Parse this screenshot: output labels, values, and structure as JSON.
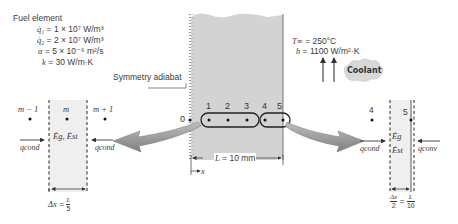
{
  "fuel_element": {
    "title": "Fuel element",
    "props": [
      {
        "sym": "q̇₁",
        "eq": " = 1 × 10⁷ W/m³"
      },
      {
        "sym": "q̇₂",
        "eq": " = 2 × 10⁷ W/m³"
      },
      {
        "sym": "α",
        "eq": " = 5 × 10⁻⁶ m²/s"
      },
      {
        "sym": "k",
        "eq": " = 30 W/m·K"
      }
    ]
  },
  "symmetry_label": "Symmetry adiabat",
  "coolant": {
    "T_inf": {
      "sym": "T∞",
      "eq": " = 250°C"
    },
    "h": {
      "sym": "h",
      "eq": " = 1100 W/m²·K"
    },
    "label": "Coolant"
  },
  "nodes": [
    "0",
    "1",
    "2",
    "3",
    "4",
    "5"
  ],
  "dimension": {
    "sym": "L",
    "eq": " = 10 mm"
  },
  "x_axis": "x",
  "left_detail": {
    "nodes": [
      "m − 1",
      "m",
      "m + 1"
    ],
    "energy": "Ėg, Ėst",
    "q_left": "qcond",
    "q_right": "qcond",
    "dx": "Δx = L/5",
    "dx_num": "Δx",
    "L": "L",
    "den": "5"
  },
  "right_detail": {
    "nodes": [
      "4",
      "5"
    ],
    "eg": "Ėg",
    "est": "Ėst",
    "q_left": "qcond",
    "q_right": "qconv",
    "dx_num": "Δx",
    "dx_den": "2",
    "L": "L",
    "den": "10"
  },
  "colors": {
    "fuel_fill": "#d4d4d4",
    "strip_fill": "#ececec",
    "arrow_fill": "#9a9a9a",
    "line": "#333333",
    "coolant_cloud": "#d9d9d9"
  }
}
